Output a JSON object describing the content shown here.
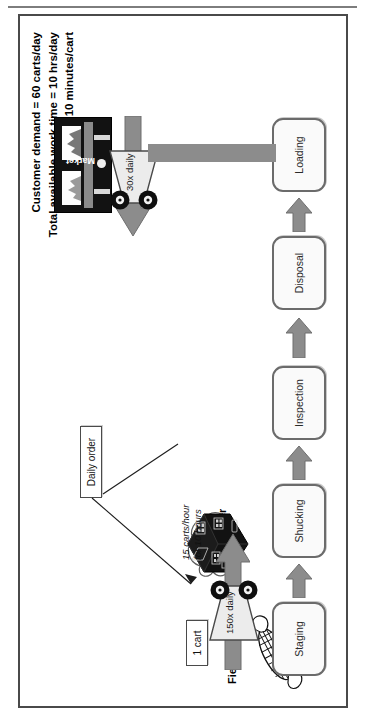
{
  "figure": {
    "metrics": [
      "Customer demand = 60 carts/day",
      "Total available work time = 10 hrs/day",
      "Takt time = 10 minutes/cart"
    ],
    "entities": {
      "supplier_label": "Fields",
      "supplier_icon": "corn-cob-icon",
      "customer_label": "Market",
      "customer_icon": "market-building-icon",
      "control_label": "Farmer",
      "control_icon": "farmhouse-cloud-icon"
    },
    "processes": [
      {
        "name": "Staging"
      },
      {
        "name": "Shucking"
      },
      {
        "name": "Inspection"
      },
      {
        "name": "Disposal"
      },
      {
        "name": "Loading"
      }
    ],
    "inventory": [
      {
        "label": "1 cart"
      }
    ],
    "information_flow": [
      {
        "label": "Daily order"
      }
    ],
    "shipments": [
      {
        "label": "150x daily",
        "icon": "truck-icon"
      },
      {
        "label": "30x daily",
        "icon": "truck-icon"
      }
    ],
    "annotations": [
      {
        "line1": "15 carts/hour",
        "line2": "for 10 hours"
      }
    ],
    "colors": {
      "arrow_gray": "#8c8c8c",
      "box_border": "#6b6b6b",
      "frame_border": "#4a4a4a",
      "dark": "#121212"
    }
  }
}
